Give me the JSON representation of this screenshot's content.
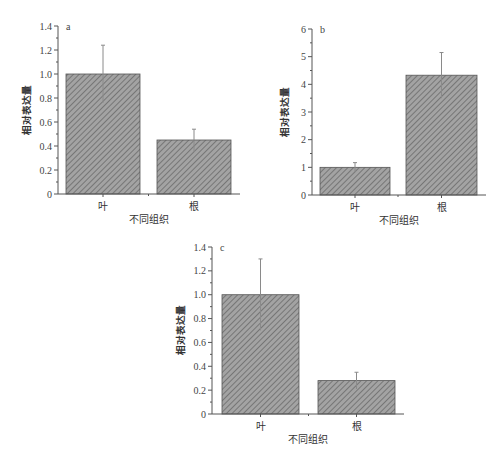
{
  "colors": {
    "bar_fill": "#9a9a9a",
    "hatch": "#6e6e6e",
    "axis": "#555555",
    "error_bar": "#8a8a8a"
  },
  "chart_data": [
    {
      "type": "bar",
      "panel": "a",
      "categories": [
        "叶",
        "根"
      ],
      "values": [
        1.0,
        0.45
      ],
      "error_low": [
        0.76,
        0.35
      ],
      "error_high": [
        1.24,
        0.54
      ],
      "xlabel": "不同组织",
      "ylabel": "相对表达量",
      "ylim": [
        0,
        1.4
      ],
      "yticks": [
        "0",
        "0.2",
        "0.4",
        "0.6",
        "0.8",
        "1.0",
        "1.2",
        "1.4"
      ],
      "grid": false,
      "fill": "hatched"
    },
    {
      "type": "bar",
      "panel": "b",
      "categories": [
        "叶",
        "根"
      ],
      "values": [
        1.0,
        4.33
      ],
      "error_low": [
        0.83,
        3.5
      ],
      "error_high": [
        1.17,
        5.15
      ],
      "xlabel": "不同组织",
      "ylabel": "相对表达量",
      "ylim": [
        0,
        6
      ],
      "yticks": [
        "0",
        "1",
        "2",
        "3",
        "4",
        "5",
        "6"
      ],
      "grid": false,
      "fill": "hatched"
    },
    {
      "type": "bar",
      "panel": "c",
      "categories": [
        "叶",
        "根"
      ],
      "values": [
        1.0,
        0.28
      ],
      "error_low": [
        0.7,
        0.21
      ],
      "error_high": [
        1.3,
        0.35
      ],
      "xlabel": "不同组织",
      "ylabel": "相对表达量",
      "ylim": [
        0,
        1.4
      ],
      "yticks": [
        "0",
        "0.2",
        "0.4",
        "0.6",
        "0.8",
        "1.0",
        "1.2",
        "1.4"
      ],
      "grid": false,
      "fill": "hatched"
    }
  ]
}
